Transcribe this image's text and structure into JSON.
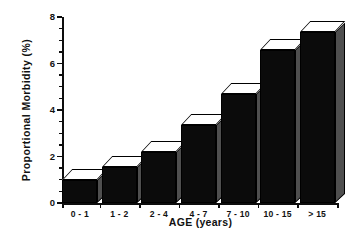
{
  "chart_data": {
    "type": "bar",
    "title": "",
    "subtitle": "",
    "xlabel": "AGE (years)",
    "ylabel": "Proportional  Morbidity  (%)",
    "categories": [
      "0 - 1",
      "1 - 2",
      "2 - 4",
      "4 - 7",
      "7 - 10",
      "10 - 15",
      "> 15"
    ],
    "values": [
      1.0,
      1.55,
      2.2,
      3.35,
      4.7,
      6.6,
      7.35
    ],
    "ylim": [
      0,
      8
    ],
    "xlim_note": "categorical",
    "ytick_labels": [
      "0",
      "2",
      "4",
      "6",
      "8"
    ],
    "ytick_values": [
      0,
      2,
      4,
      6,
      8
    ],
    "yminor_step": 0.5,
    "grid": false,
    "legend": null,
    "legend_position": "none",
    "annotations": [],
    "style": {
      "bar_face_color": "#0b0b0b",
      "bar_top_color": "#ffffff",
      "bar_side_color": "#4f4f4f",
      "bar_edge_color": "#000000",
      "axis_color": "#0d0d0d",
      "background_color": "#ffffff",
      "effect": "3d-extruded-bars"
    }
  }
}
